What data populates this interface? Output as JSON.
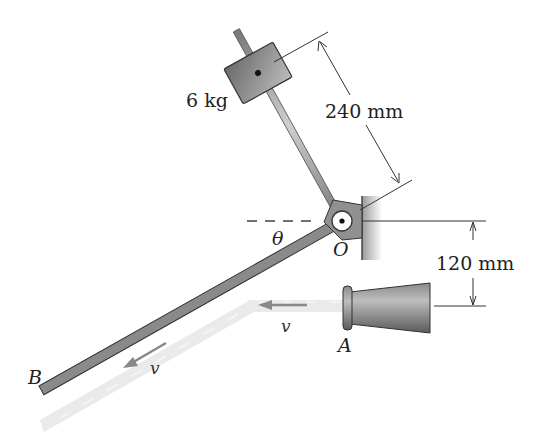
{
  "figure": {
    "type": "mechanics diagram",
    "labels": {
      "mass": "6 kg",
      "rod_length": "240 mm",
      "offset": "120 mm",
      "angle": "θ",
      "pivot": "O",
      "nozzle": "A",
      "plate_end": "B",
      "velocity_jet": "v",
      "velocity_plate": "v"
    },
    "colors": {
      "metal_dark": "#6e6e6e",
      "metal_mid": "#8c8c8c",
      "metal_light": "#b8b8b8",
      "water": "#e4e4e4",
      "dimension_line": "#333333",
      "arrow": "#8a8a8a"
    }
  }
}
